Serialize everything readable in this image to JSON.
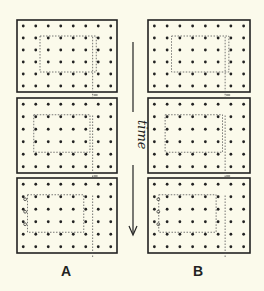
{
  "figure": {
    "columns": [
      {
        "label": "A",
        "x": 17,
        "width": 100
      },
      {
        "label": "B",
        "x": 148,
        "width": 102
      }
    ],
    "rows": [
      {
        "y": 20,
        "height": 72
      },
      {
        "y": 98,
        "height": 75
      },
      {
        "y": 178,
        "height": 75
      }
    ],
    "dot_grid": {
      "cols": 8,
      "rows": 6
    },
    "time_axis": {
      "label": "time",
      "direction": "down"
    },
    "colors": {
      "background": "#fbfaeb",
      "ink": "#222222",
      "dotted": "#555555"
    }
  },
  "labels": {
    "a": "A",
    "b": "B",
    "time": "time"
  }
}
